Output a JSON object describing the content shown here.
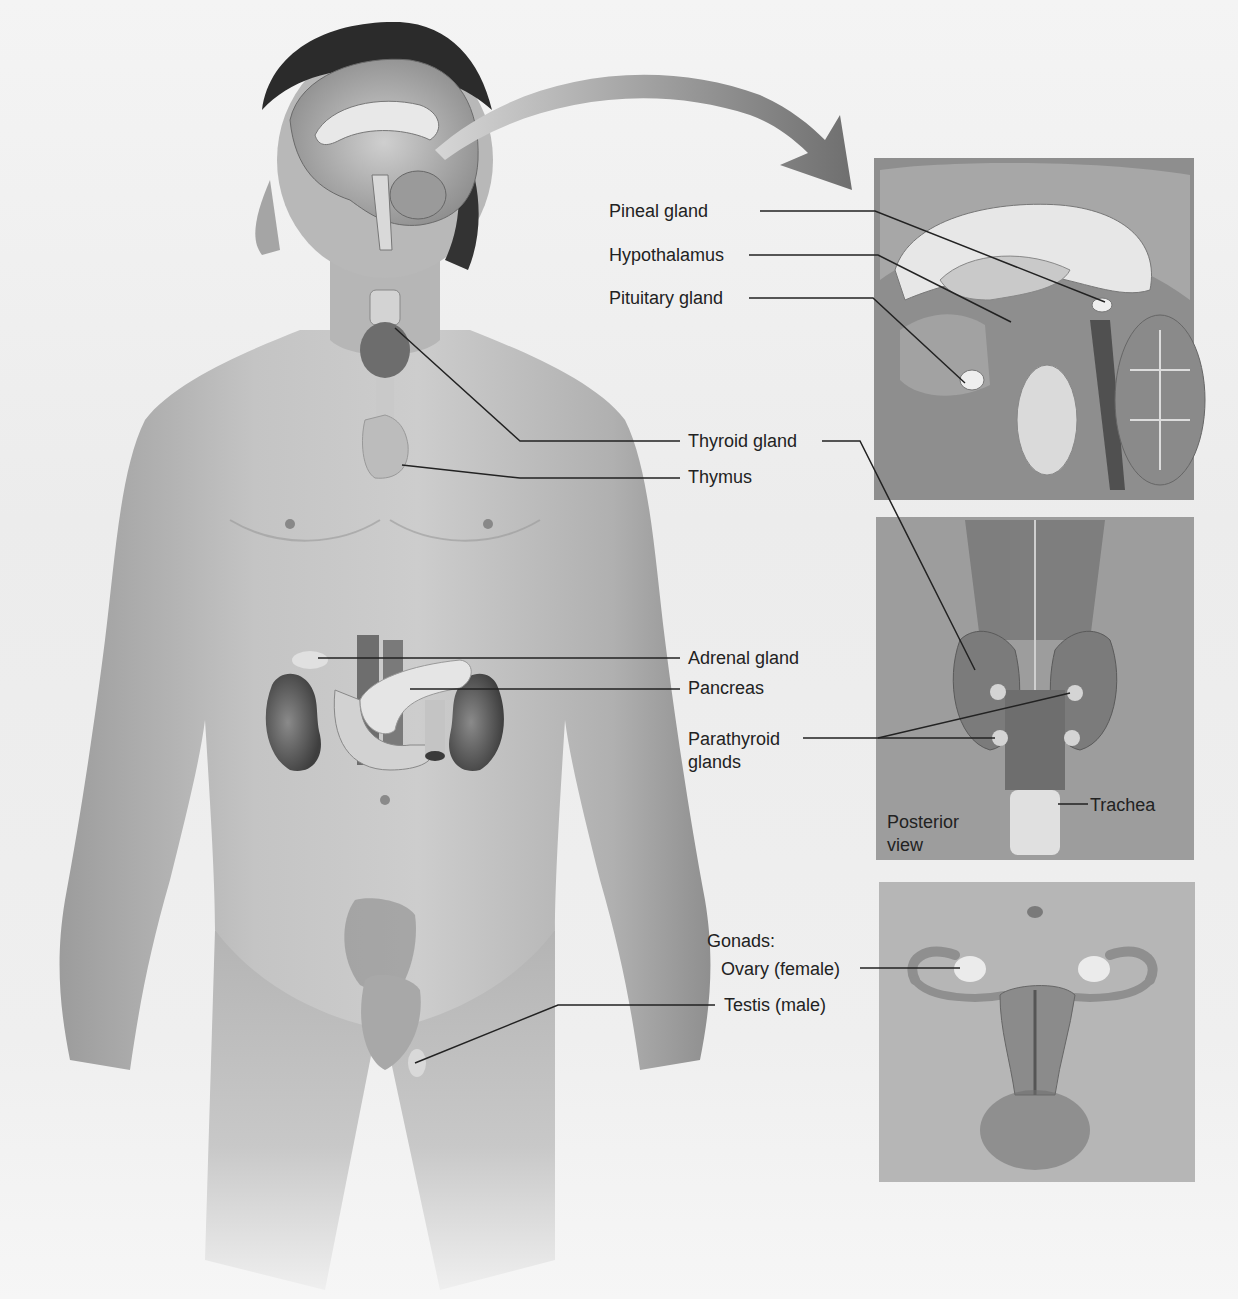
{
  "figure": {
    "colors": {
      "background": "#efefef",
      "skin": "#bdbdbd",
      "skin_shadow": "#9a9a9a",
      "hair": "#2a2a2a",
      "leader_line": "#222222",
      "arrow": "#7a7a7a",
      "panel_brain_bg": "#8d8d8d",
      "panel_thyroid_bg": "#9a9a9a",
      "panel_pelvis_bg": "#b5b5b5",
      "label_text": "#222222"
    }
  },
  "labels": {
    "pineal": "Pineal gland",
    "hypothalamus": "Hypothalamus",
    "pituitary": "Pituitary gland",
    "thyroid": "Thyroid gland",
    "thymus": "Thymus",
    "adrenal": "Adrenal gland",
    "pancreas": "Pancreas",
    "parathyroid_line1": "Parathyroid",
    "parathyroid_line2": "glands",
    "trachea": "Trachea",
    "posterior_line1": "Posterior",
    "posterior_line2": "view",
    "gonads": "Gonads:",
    "ovary": "Ovary (female)",
    "testis": "Testis (male)"
  },
  "panels": {
    "brain": {
      "name": "Sagittal brain section (enlarged)"
    },
    "thyroid": {
      "name": "Thyroid and parathyroid, posterior view"
    },
    "pelvis": {
      "name": "Female reproductive organs"
    }
  }
}
